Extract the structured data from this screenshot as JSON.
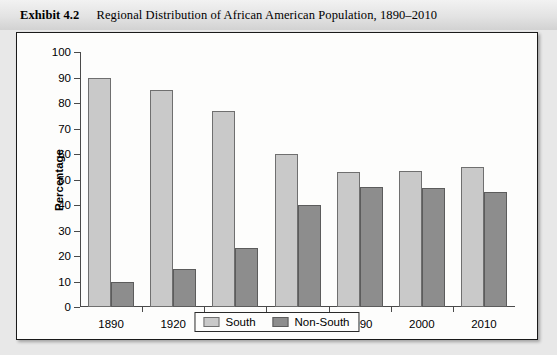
{
  "header": {
    "exhibit_label": "Exhibit 4.2",
    "exhibit_title": "Regional Distribution of African American Population, 1890–2010"
  },
  "chart_data": {
    "type": "bar",
    "title": "Regional Distribution of African American Population, 1890–2010",
    "xlabel": "",
    "ylabel": "Percentage",
    "ylim": [
      0,
      100
    ],
    "ytick_step": 10,
    "yticks": [
      0,
      10,
      20,
      30,
      40,
      50,
      60,
      70,
      80,
      90,
      100
    ],
    "grid": false,
    "legend_position": "bottom-center",
    "categories": [
      "1890",
      "1920",
      "1940",
      "1960",
      "1990",
      "2000",
      "2010"
    ],
    "series": [
      {
        "name": "South",
        "color": "#c9c9c9",
        "values": [
          90,
          85,
          77,
          60,
          53,
          53.5,
          55
        ]
      },
      {
        "name": "Non-South",
        "color": "#8d8d8d",
        "values": [
          10,
          15,
          23,
          40,
          47,
          46.5,
          45
        ]
      }
    ]
  }
}
